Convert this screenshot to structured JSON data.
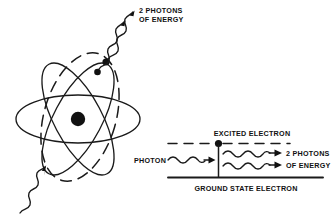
{
  "figure": {
    "title_visible": false,
    "background_color": "#ffffff",
    "ink_color": "#1a1a1a",
    "labels": {
      "atom_photons_line1": "2 PHOTONS",
      "atom_photons_line2": "OF ENERGY",
      "excited_electron": "EXCITED ELECTRON",
      "photon_incoming": "PHOTON",
      "emitted_photons_line1": "2 PHOTONS",
      "emitted_photons_line2": "OF ENERGY",
      "ground_state_electron": "GROUND STATE ELECTRON"
    },
    "atom_diagram": {
      "nucleus_label": "nucleus",
      "orbit_count": 3,
      "excited_orbit_style": "dashed",
      "electron_count": 2,
      "incoming_photon_count": 1,
      "outgoing_photon_count": 2
    },
    "energy_level_diagram": {
      "excited_level_style": "dashed",
      "ground_level_style": "solid",
      "incoming_photon_count": 1,
      "outgoing_photon_count": 2,
      "electron_marker": "filled-dot"
    }
  }
}
